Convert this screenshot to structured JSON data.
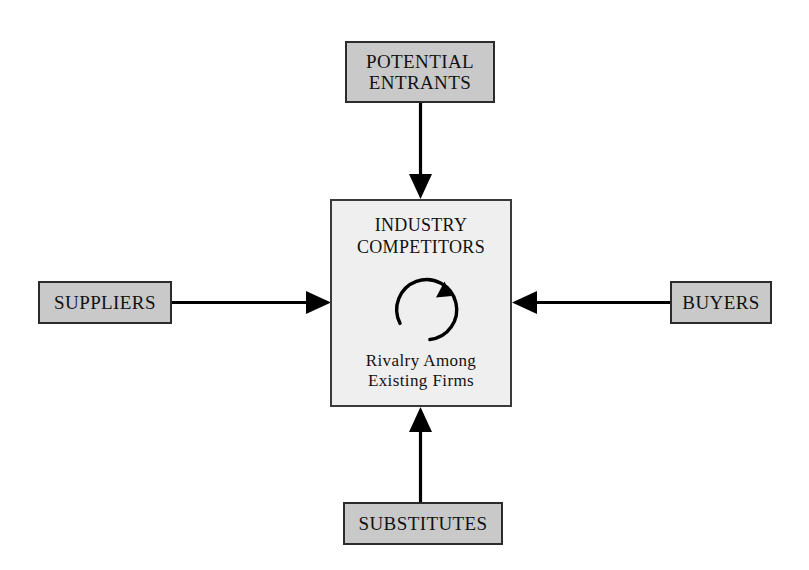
{
  "diagram": {
    "type": "porter-five-forces",
    "colors": {
      "outer_box_fill": "#c9c9c9",
      "center_box_fill": "#efefef",
      "border": "#2b2b2b",
      "arrow": "#000000",
      "background": "#ffffff",
      "text": "#111111"
    },
    "center": {
      "title": "INDUSTRY\nCOMPETITORS",
      "caption": "Rivalry Among\nExisting Firms",
      "rivalry_icon": "circular-arrow-clockwise-icon"
    },
    "forces": [
      {
        "id": "potential-entrants",
        "label": "POTENTIAL\nENTRANTS",
        "position": "top",
        "arrow_direction": "down"
      },
      {
        "id": "suppliers",
        "label": "SUPPLIERS",
        "position": "left",
        "arrow_direction": "right"
      },
      {
        "id": "buyers",
        "label": "BUYERS",
        "position": "right",
        "arrow_direction": "left"
      },
      {
        "id": "substitutes",
        "label": "SUBSTITUTES",
        "position": "bottom",
        "arrow_direction": "up"
      }
    ],
    "arrows": [
      {
        "id": "arrow-entrants-to-center",
        "name": "arrow-down-from-potential-entrants"
      },
      {
        "id": "arrow-suppliers-to-center",
        "name": "arrow-right-from-suppliers"
      },
      {
        "id": "arrow-buyers-to-center",
        "name": "arrow-left-from-buyers"
      },
      {
        "id": "arrow-substitutes-to-center",
        "name": "arrow-up-from-substitutes"
      }
    ]
  }
}
